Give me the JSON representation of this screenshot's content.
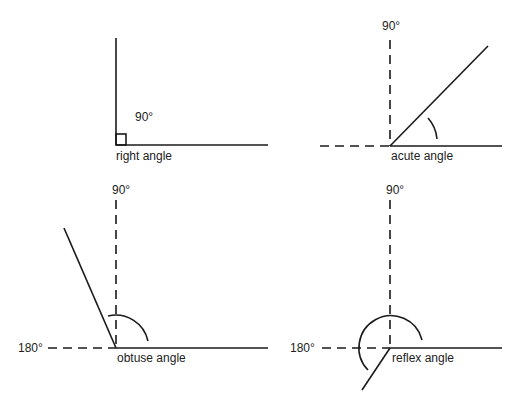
{
  "diagrams": [
    {
      "name": "right-angle",
      "label": "right angle",
      "degree_label": "90°"
    },
    {
      "name": "acute-angle",
      "label": "acute angle",
      "degree_label": "90°"
    },
    {
      "name": "obtuse-angle",
      "label": "obtuse angle",
      "degree_label_top": "90°",
      "degree_label_left": "180°"
    },
    {
      "name": "reflex-angle",
      "label": "reflex angle",
      "degree_label_top": "90°",
      "degree_label_left": "180°"
    }
  ],
  "colors": {
    "line": "#1a1a1a",
    "text": "#222222",
    "background": "#ffffff"
  }
}
